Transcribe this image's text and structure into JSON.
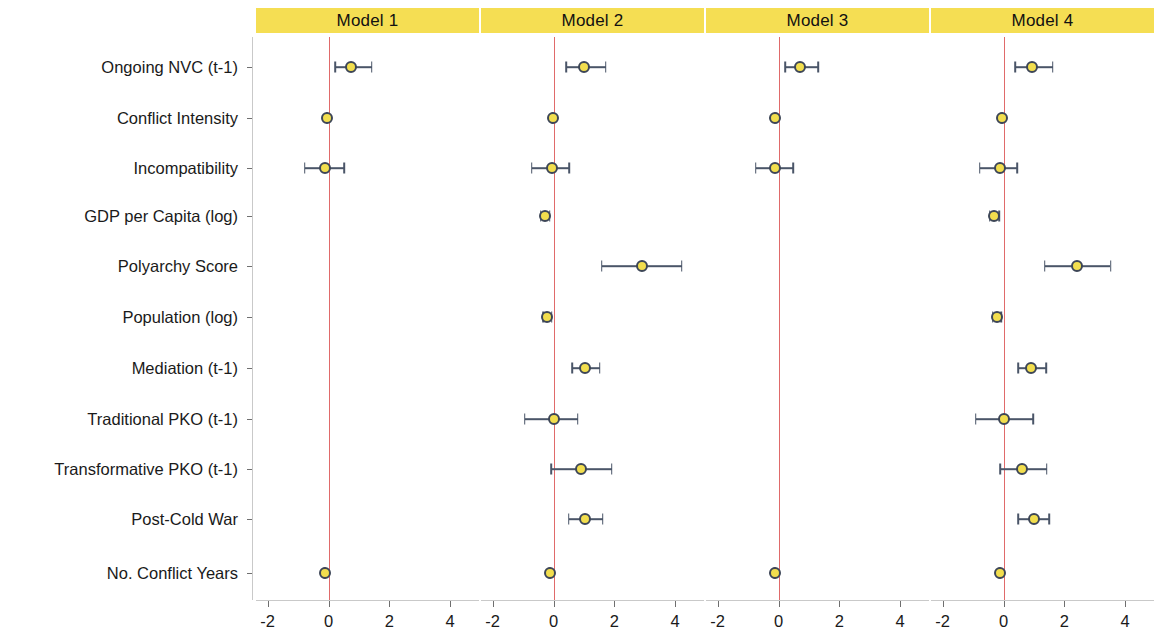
{
  "figure": {
    "panel_header_color": "#F5DE53",
    "zero_line_color": "#e06a6a",
    "point_fill_color": "#F2DE4E",
    "point_edge_color": "#3d4657",
    "error_bar_color": "#4a5568"
  },
  "chart_data": {
    "type": "scatter",
    "title": "",
    "xlabel": "",
    "ylabel": "",
    "xlim": [
      -3.2,
      5.0
    ],
    "xticks": [
      -2,
      0,
      2,
      4
    ],
    "xtick_labels": [
      "-2",
      "0",
      "2",
      "4"
    ],
    "grid": false,
    "legend": "none",
    "reference_line": 0,
    "panels": [
      "Model 1",
      "Model 2",
      "Model 3",
      "Model 4"
    ],
    "categories": [
      "Ongoing NVC (t-1)",
      "Conflict Intensity",
      "Incompatibility",
      "GDP per Capita (log)",
      "Polyarchy Score",
      "Population (log)",
      "Mediation (t-1)",
      "Traditional PKO (t-1)",
      "Transformative PKO (t-1)",
      "Post-Cold War",
      "No. Conflict Years"
    ],
    "series": [
      {
        "name": "Model 1",
        "points": [
          {
            "term": "Ongoing NVC (t-1)",
            "estimate": 0.75,
            "low": 0.22,
            "high": 1.42
          },
          {
            "term": "Conflict Intensity",
            "estimate": -0.05,
            "low": -0.06,
            "high": -0.04
          },
          {
            "term": "Incompatibility",
            "estimate": -0.1,
            "low": -0.78,
            "high": 0.52
          },
          {
            "term": "GDP per Capita (log)",
            "estimate": null,
            "low": null,
            "high": null
          },
          {
            "term": "Polyarchy Score",
            "estimate": null,
            "low": null,
            "high": null
          },
          {
            "term": "Population (log)",
            "estimate": null,
            "low": null,
            "high": null
          },
          {
            "term": "Mediation (t-1)",
            "estimate": null,
            "low": null,
            "high": null
          },
          {
            "term": "Traditional PKO (t-1)",
            "estimate": null,
            "low": null,
            "high": null
          },
          {
            "term": "Transformative PKO (t-1)",
            "estimate": null,
            "low": null,
            "high": null
          },
          {
            "term": "Post-Cold War",
            "estimate": null,
            "low": null,
            "high": null
          },
          {
            "term": "No. Conflict Years",
            "estimate": -0.12,
            "low": -0.14,
            "high": -0.1
          }
        ]
      },
      {
        "name": "Model 2",
        "points": [
          {
            "term": "Ongoing NVC (t-1)",
            "estimate": 1.0,
            "low": 0.42,
            "high": 1.72
          },
          {
            "term": "Conflict Intensity",
            "estimate": -0.03,
            "low": -0.05,
            "high": -0.02
          },
          {
            "term": "Incompatibility",
            "estimate": -0.06,
            "low": -0.72,
            "high": 0.52
          },
          {
            "term": "GDP per Capita (log)",
            "estimate": -0.28,
            "low": -0.42,
            "high": -0.12
          },
          {
            "term": "Polyarchy Score",
            "estimate": 2.9,
            "low": 1.58,
            "high": 4.22
          },
          {
            "term": "Population (log)",
            "estimate": -0.2,
            "low": -0.34,
            "high": -0.06
          },
          {
            "term": "Mediation (t-1)",
            "estimate": 1.05,
            "low": 0.62,
            "high": 1.52
          },
          {
            "term": "Traditional PKO (t-1)",
            "estimate": 0.0,
            "low": -0.95,
            "high": 0.8
          },
          {
            "term": "Transformative PKO (t-1)",
            "estimate": 0.9,
            "low": -0.08,
            "high": 1.92
          },
          {
            "term": "Post-Cold War",
            "estimate": 1.05,
            "low": 0.5,
            "high": 1.62
          },
          {
            "term": "No. Conflict Years",
            "estimate": -0.12,
            "low": -0.15,
            "high": -0.09
          }
        ]
      },
      {
        "name": "Model 3",
        "points": [
          {
            "term": "Ongoing NVC (t-1)",
            "estimate": 0.72,
            "low": 0.22,
            "high": 1.3
          },
          {
            "term": "Conflict Intensity",
            "estimate": -0.1,
            "low": -0.12,
            "high": -0.08
          },
          {
            "term": "Incompatibility",
            "estimate": -0.12,
            "low": -0.75,
            "high": 0.48
          },
          {
            "term": "GDP per Capita (log)",
            "estimate": null,
            "low": null,
            "high": null
          },
          {
            "term": "Polyarchy Score",
            "estimate": null,
            "low": null,
            "high": null
          },
          {
            "term": "Population (log)",
            "estimate": null,
            "low": null,
            "high": null
          },
          {
            "term": "Mediation (t-1)",
            "estimate": null,
            "low": null,
            "high": null
          },
          {
            "term": "Traditional PKO (t-1)",
            "estimate": null,
            "low": null,
            "high": null
          },
          {
            "term": "Transformative PKO (t-1)",
            "estimate": null,
            "low": null,
            "high": null
          },
          {
            "term": "Post-Cold War",
            "estimate": null,
            "low": null,
            "high": null
          },
          {
            "term": "No. Conflict Years",
            "estimate": -0.12,
            "low": -0.14,
            "high": -0.1
          }
        ]
      },
      {
        "name": "Model 4",
        "points": [
          {
            "term": "Ongoing NVC (t-1)",
            "estimate": 0.95,
            "low": 0.38,
            "high": 1.62
          },
          {
            "term": "Conflict Intensity",
            "estimate": -0.05,
            "low": -0.07,
            "high": -0.03
          },
          {
            "term": "Incompatibility",
            "estimate": -0.12,
            "low": -0.78,
            "high": 0.45
          },
          {
            "term": "GDP per Capita (log)",
            "estimate": -0.3,
            "low": -0.45,
            "high": -0.15
          },
          {
            "term": "Polyarchy Score",
            "estimate": 2.42,
            "low": 1.35,
            "high": 3.52
          },
          {
            "term": "Population (log)",
            "estimate": -0.22,
            "low": -0.36,
            "high": -0.08
          },
          {
            "term": "Mediation (t-1)",
            "estimate": 0.92,
            "low": 0.48,
            "high": 1.4
          },
          {
            "term": "Traditional PKO (t-1)",
            "estimate": 0.02,
            "low": -0.92,
            "high": 0.98
          },
          {
            "term": "Transformative PKO (t-1)",
            "estimate": 0.62,
            "low": -0.1,
            "high": 1.42
          },
          {
            "term": "Post-Cold War",
            "estimate": 1.0,
            "low": 0.48,
            "high": 1.5
          },
          {
            "term": "No. Conflict Years",
            "estimate": -0.12,
            "low": -0.15,
            "high": -0.09
          }
        ]
      }
    ]
  }
}
